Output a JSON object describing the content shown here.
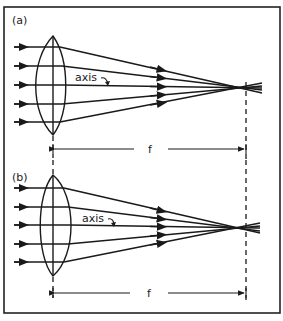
{
  "figure": {
    "panels": [
      {
        "label": "(a)",
        "axis_label": "axis",
        "focal_label": "f",
        "lens": "thin biconvex lens",
        "rays_count": 5
      },
      {
        "label": "(b)",
        "axis_label": "axis",
        "focal_label": "f",
        "lens": "thick biconvex lens",
        "rays_count": 5
      }
    ]
  },
  "colors": {
    "ink": "#1a1a1a",
    "background": "#ffffff"
  }
}
